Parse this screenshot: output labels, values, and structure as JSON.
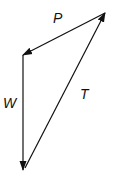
{
  "diagram": {
    "type": "vector-triangle",
    "vectors": [
      {
        "name": "P",
        "label": "P",
        "from": [
          105,
          13
        ],
        "to": [
          23,
          55
        ]
      },
      {
        "name": "W",
        "label": "W",
        "from": [
          23,
          55
        ],
        "to": [
          23,
          170
        ]
      },
      {
        "name": "T",
        "label": "T",
        "from": [
          25,
          168
        ],
        "to": [
          105,
          13
        ]
      }
    ],
    "stroke_color": "#111111"
  }
}
